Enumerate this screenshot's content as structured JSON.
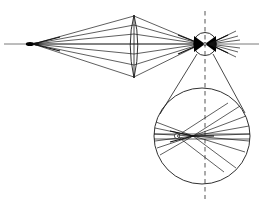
{
  "figure": {
    "title": "Optical ray diagram: point source through converging lens to eye with magnified detail",
    "background_color": "#ffffff",
    "ray_color": "#1a1a1a",
    "axis_color": "#6b6b6b",
    "dashed_axis_color": "#555555",
    "width": 263,
    "height": 209
  },
  "optical_axis": {
    "label": "optical-axis",
    "y": 44,
    "x_start": 4,
    "x_end": 259
  },
  "point_source": {
    "label": "point-source",
    "x": 30,
    "y": 44
  },
  "lens": {
    "label": "converging-lens",
    "center_x": 134,
    "top_y": 15,
    "bottom_y": 78,
    "half_width": 6.5
  },
  "eye": {
    "label": "eye",
    "center_x": 205,
    "center_y": 44,
    "radius": 11.5
  },
  "magnified_eye": {
    "label": "magnified-eye-detail",
    "center_x": 202,
    "center_y": 136,
    "radius": 48,
    "focus_x": 193,
    "focus_y": 136,
    "cross_x": 176,
    "cross_y": 136
  },
  "dashed_vertical_axis": {
    "label": "vertical-reference-axis",
    "x": 205,
    "y_start": 11,
    "y_end": 199
  },
  "magnifier_cone": {
    "label": "magnification-cone",
    "apex_left_x": 196,
    "apex_right_x": 214,
    "apex_y": 53,
    "base_left_x": 160,
    "base_right_x": 245,
    "base_y": 110
  },
  "ray_bundles": {
    "source_to_lens_count": 7,
    "lens_to_eye_count": 7,
    "eye_exit_count": 7,
    "magnified_left_count": 6,
    "magnified_right_count": 7
  }
}
